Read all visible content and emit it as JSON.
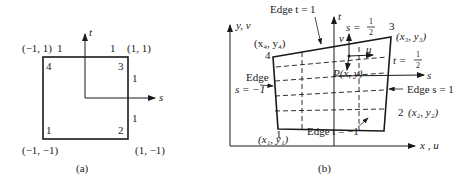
{
  "figure_a": {
    "caption": "(a)",
    "axes": {
      "horizontal": "s",
      "vertical": "t"
    },
    "corners": [
      {
        "node": "1",
        "coord": "(−1, −1)"
      },
      {
        "node": "2",
        "coord": "(1, −1)"
      },
      {
        "node": "3",
        "coord": "(1, 1)"
      },
      {
        "node": "4",
        "coord": "(−1, 1)"
      }
    ],
    "half_lengths": {
      "top_left": "1",
      "top_right": "1",
      "right_upper": "1",
      "right_lower": "1"
    }
  },
  "figure_b": {
    "caption": "(b)",
    "global_axes": {
      "horizontal": "x , u",
      "vertical": "y, v"
    },
    "local_axes": {
      "horizontal": "s",
      "vertical": "t"
    },
    "nodes": [
      {
        "node": "1",
        "coord": "(x₁, y₁)"
      },
      {
        "node": "2",
        "coord": "(x₂, y₂)"
      },
      {
        "node": "3",
        "coord": "(x₃, y₃)"
      },
      {
        "node": "4",
        "coord": "(x₄, y₄)"
      }
    ],
    "edge_labels": {
      "top": "Edge t = 1",
      "bottom": "Edge t = −1",
      "left_line1": "Edge",
      "left_line2": "s = −1",
      "right": "Edge s = 1"
    },
    "point": "P(x, y)",
    "displacements": {
      "u": "u",
      "v": "v"
    },
    "iso_lines": {
      "s": "s =",
      "s_num": "1",
      "s_den": "2",
      "t": "t =",
      "t_num": "1",
      "t_den": "2"
    }
  }
}
